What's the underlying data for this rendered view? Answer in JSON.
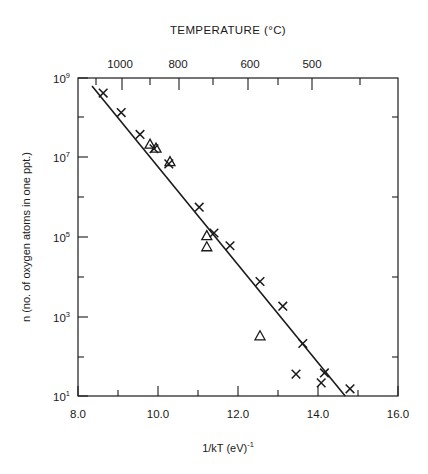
{
  "figure": {
    "background_color": "#ffffff",
    "ink_color": "#1a1a1a",
    "width": 428,
    "height": 474
  },
  "top_axis": {
    "title": "TEMPERATURE (°C)",
    "tick_labels": [
      "1000",
      "800",
      "600",
      "500"
    ]
  },
  "bottom_axis": {
    "label_main": "1/kT (eV)",
    "label_exponent": "-1",
    "tick_labels": [
      "8.0",
      "10.0",
      "12.0",
      "14.0",
      "16.0"
    ]
  },
  "y_axis": {
    "label": "n (no. of oxygen atoms in one ppt.)",
    "tick_mantissa": "10",
    "tick_exponents": [
      "9",
      "7",
      "5",
      "3",
      "1"
    ]
  },
  "chart_data": {
    "type": "scatter",
    "title": "TEMPERATURE (°C)",
    "xlabel": "1/kT (eV)-1",
    "ylabel": "n (no. of oxygen atoms in one ppt.)",
    "xlim": [
      8.0,
      16.0
    ],
    "ylim_log10": [
      1,
      9
    ],
    "yscale": "log",
    "grid": false,
    "legend": "none",
    "x_ticks": [
      8.0,
      10.0,
      12.0,
      14.0,
      16.0
    ],
    "x_minor_ticks": [
      9.0,
      11.0,
      13.0,
      15.0
    ],
    "y_ticks_log10": [
      9,
      7,
      5,
      3,
      1
    ],
    "y_minor_ticks_log10": [
      8,
      6,
      4,
      2
    ],
    "top_axis": {
      "label": "TEMPERATURE (°C)",
      "tick_labels": [
        "1000",
        "800",
        "600",
        "500"
      ],
      "tick_x_values": [
        9.11,
        10.53,
        12.29,
        13.36
      ],
      "minor_tick_x_values": [
        8.45,
        9.81,
        11.37,
        13.0,
        14.22,
        15.05
      ]
    },
    "series": [
      {
        "name": "crosses",
        "marker": "x",
        "points": [
          {
            "x": 8.63,
            "y_log10": 8.62
          },
          {
            "x": 9.08,
            "y_log10": 8.13
          },
          {
            "x": 9.55,
            "y_log10": 7.58
          },
          {
            "x": 9.9,
            "y_log10": 7.22
          },
          {
            "x": 10.27,
            "y_log10": 6.84
          },
          {
            "x": 11.03,
            "y_log10": 5.75
          },
          {
            "x": 11.4,
            "y_log10": 5.1
          },
          {
            "x": 11.8,
            "y_log10": 4.78
          },
          {
            "x": 12.55,
            "y_log10": 3.88
          },
          {
            "x": 13.12,
            "y_log10": 3.26
          },
          {
            "x": 13.62,
            "y_log10": 2.32
          },
          {
            "x": 13.45,
            "y_log10": 1.55
          },
          {
            "x": 14.08,
            "y_log10": 1.33
          },
          {
            "x": 14.16,
            "y_log10": 1.58
          },
          {
            "x": 14.8,
            "y_log10": 1.18
          }
        ]
      },
      {
        "name": "triangles",
        "marker": "triangle",
        "points": [
          {
            "x": 9.8,
            "y_log10": 7.32
          },
          {
            "x": 9.95,
            "y_log10": 7.22
          },
          {
            "x": 10.3,
            "y_log10": 6.88
          },
          {
            "x": 11.22,
            "y_log10": 5.02
          },
          {
            "x": 11.22,
            "y_log10": 4.74
          },
          {
            "x": 12.55,
            "y_log10": 2.5
          }
        ]
      }
    ],
    "fit_line": {
      "name": "best-fit line",
      "x_start": 8.35,
      "y_log10_start": 8.8,
      "x_end": 14.68,
      "y_log10_end": 1.0
    }
  }
}
